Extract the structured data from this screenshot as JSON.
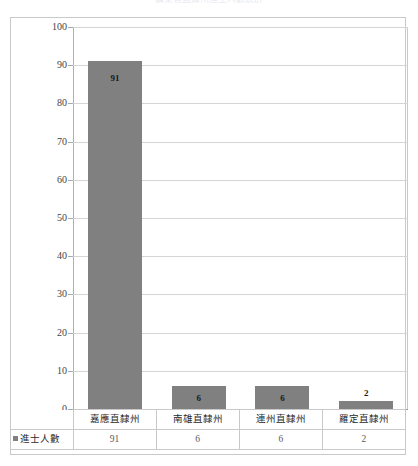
{
  "title_sliver": "廣東省直隸州進士人數統計",
  "legend": {
    "series_label": "進士人數",
    "swatch_color": "#808080",
    "marker": "legend-square-marker"
  },
  "axis": {
    "y_ticks": [
      "0",
      "10",
      "20",
      "30",
      "40",
      "50",
      "60",
      "70",
      "80",
      "90",
      "100"
    ],
    "y_min": 0,
    "y_max": 100,
    "y_step": 10
  },
  "colors": {
    "bar": "#808080",
    "gridline": "#d4d4d4",
    "axis": "#9a9a9a",
    "frame": "#c9c9c9",
    "label_text": "#2a2a2a",
    "value_text": "#5a5a5a"
  },
  "chart_data": {
    "type": "bar",
    "title": "廣東省直隸州進士人數統計",
    "xlabel": "",
    "ylabel": "",
    "ylim": [
      0,
      100
    ],
    "grid": true,
    "legend_position": "table-row-header",
    "categories": [
      "嘉應直隸州",
      "南雄直隸州",
      "連州直隸州",
      "羅定直隸州"
    ],
    "series": [
      {
        "name": "進士人數",
        "values": [
          91,
          6,
          6,
          2
        ],
        "color": "#808080"
      }
    ],
    "data_labels": [
      "91",
      "6",
      "6",
      "2"
    ]
  },
  "table": {
    "row_header": "進士人數",
    "columns": [
      "嘉應直隸州",
      "南雄直隸州",
      "連州直隸州",
      "羅定直隸州"
    ],
    "values": [
      "91",
      "6",
      "6",
      "2"
    ]
  }
}
